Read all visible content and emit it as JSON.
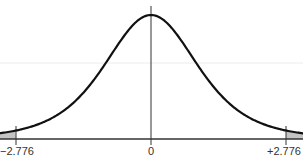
{
  "chart_data": {
    "type": "line",
    "title": "",
    "subtitle": "",
    "xlabel": "",
    "ylabel": "",
    "x_ticks": [
      "−2.776",
      "0",
      "+2.776"
    ],
    "x_tick_values": [
      -2.776,
      0,
      2.776
    ],
    "xlim": [
      -3.0,
      3.0
    ],
    "critical_values": {
      "lower": -2.776,
      "upper": 2.776
    },
    "shaded_regions": [
      {
        "from": -3.0,
        "to": -2.776,
        "label": "lower tail"
      },
      {
        "from": 2.776,
        "to": 3.0,
        "label": "upper tail"
      }
    ],
    "center_line": 0,
    "grid": {
      "horizontal": true,
      "vertical": false
    },
    "legend": null,
    "series": [
      {
        "name": "density",
        "x": [
          -3.0,
          -2.776,
          -2.5,
          -2.0,
          -1.5,
          -1.0,
          -0.5,
          0,
          0.5,
          1.0,
          1.5,
          2.0,
          2.5,
          2.776,
          3.0
        ],
        "values": [
          0.02,
          0.03,
          0.04,
          0.07,
          0.12,
          0.2,
          0.3,
          0.38,
          0.3,
          0.2,
          0.12,
          0.07,
          0.04,
          0.03,
          0.02
        ]
      }
    ]
  },
  "colors": {
    "curve": "#111111",
    "axis": "#333333",
    "shade": "#bfbfbf",
    "grid": "#e8e8e8"
  },
  "labels": {
    "lower": "−2.776",
    "center": "0",
    "upper": "+2.776"
  }
}
